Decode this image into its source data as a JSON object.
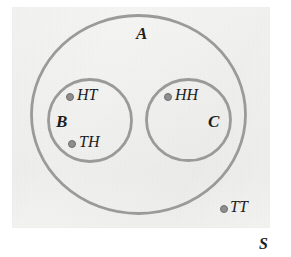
{
  "figure": {
    "kind": "venn-diagram",
    "background_color": "#ffffff",
    "paper_color": "#f1f1f0",
    "stroke_color": "#9a9a9a",
    "point_color": "#8e8e8e",
    "text_color": "#1d1d1d"
  },
  "sets": [
    {
      "id": "A",
      "label": "A",
      "label_x": 136,
      "label_y": 25,
      "cx": 138.5,
      "cy": 114.5,
      "rx": 108.5,
      "ry": 100.5
    },
    {
      "id": "B",
      "label": "B",
      "label_x": 56,
      "label_y": 113,
      "cx": 90,
      "cy": 120.5,
      "rx": 43,
      "ry": 42.5
    },
    {
      "id": "C",
      "label": "C",
      "label_x": 208,
      "label_y": 113,
      "cx": 188.5,
      "cy": 120,
      "rx": 43.5,
      "ry": 42
    },
    {
      "id": "S",
      "label": "S",
      "label_x": 259,
      "label_y": 236
    }
  ],
  "outcomes": [
    {
      "label": "HT",
      "dot_x": 68,
      "dot_y": 96,
      "text_x": 78,
      "text_y": 90,
      "member_of": "B"
    },
    {
      "label": "TH",
      "dot_x": 70,
      "dot_y": 143,
      "text_x": 80,
      "text_y": 137,
      "member_of": "B"
    },
    {
      "label": "HH",
      "dot_x": 166,
      "dot_y": 96,
      "text_x": 176,
      "text_y": 90,
      "member_of": "C"
    },
    {
      "label": "TT",
      "dot_x": 222,
      "dot_y": 208,
      "text_x": 231,
      "text_y": 202,
      "member_of": "A"
    }
  ]
}
